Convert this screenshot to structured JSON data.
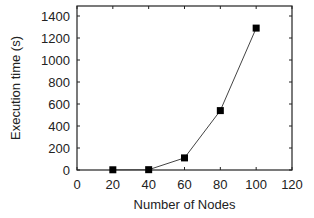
{
  "chart_data": {
    "type": "line",
    "title": "",
    "xlabel": "Number of Nodes",
    "ylabel": "Execution time (s)",
    "xlim": [
      0,
      120
    ],
    "ylim": [
      0,
      1500
    ],
    "xticks": [
      0,
      20,
      40,
      60,
      80,
      100,
      120
    ],
    "yticks": [
      0,
      200,
      400,
      600,
      800,
      1000,
      1200,
      1400
    ],
    "grid": false,
    "legend": null,
    "series": [
      {
        "name": "Execution time",
        "marker": "square",
        "color": "#000000",
        "x": [
          20,
          40,
          60,
          80,
          100
        ],
        "y": [
          2,
          3,
          110,
          540,
          1290
        ]
      }
    ]
  }
}
